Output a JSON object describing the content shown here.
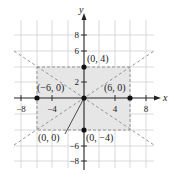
{
  "axes": {
    "x_label": "x",
    "y_label": "y",
    "x_ticks": [
      {
        "value": -8,
        "label": "−8"
      },
      {
        "value": -4,
        "label": "−4"
      },
      {
        "value": 4,
        "label": "4"
      },
      {
        "value": 8,
        "label": "8"
      }
    ],
    "y_ticks": [
      {
        "value": 8,
        "label": "8"
      },
      {
        "value": 6,
        "label": "6"
      },
      {
        "value": 2,
        "label": "2"
      },
      {
        "value": -6,
        "label": "−6"
      },
      {
        "value": -8,
        "label": "−8"
      }
    ],
    "range": {
      "xmin": -9,
      "xmax": 9,
      "ymin": -9,
      "ymax": 9
    }
  },
  "shaded_rectangle": {
    "x1": -6,
    "y1": -4,
    "x2": 6,
    "y2": 4,
    "fill": "#e6e6e6",
    "stroke": "#888888"
  },
  "asymptotes": [
    {
      "equation": "y = (2/3)x",
      "slope": 0.6667
    },
    {
      "equation": "y = -(2/3)x",
      "slope": -0.6667
    }
  ],
  "points": [
    {
      "x": 0,
      "y": 4,
      "label": "(0, 4)"
    },
    {
      "x": -6,
      "y": 0,
      "label": "(−6, 0)"
    },
    {
      "x": 6,
      "y": 0,
      "label": "(6, 0)"
    },
    {
      "x": 0,
      "y": 0,
      "label": "(0, 0)"
    },
    {
      "x": 0,
      "y": -4,
      "label": "(0, −4)"
    }
  ],
  "colors": {
    "grid": "#d0d0d0",
    "axis": "#222222",
    "dashed": "#8a8a8a",
    "point": "#111111"
  }
}
